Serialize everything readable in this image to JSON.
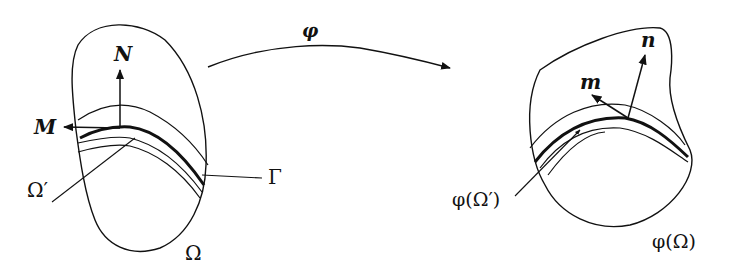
{
  "figure": {
    "colors": {
      "ink": "#111111",
      "background": "#ffffff"
    },
    "source_domain": {
      "region_label": "Ω",
      "subregion_label": "Ω′",
      "interface_label": "Γ",
      "normal_vector_label": "N",
      "tangent_vector_label": "M"
    },
    "mapping": {
      "label": "φ"
    },
    "target_domain": {
      "region_label": "φ(Ω)",
      "subregion_label": "φ(Ω′)",
      "normal_vector_label": "n",
      "tangent_vector_label": "m"
    }
  }
}
